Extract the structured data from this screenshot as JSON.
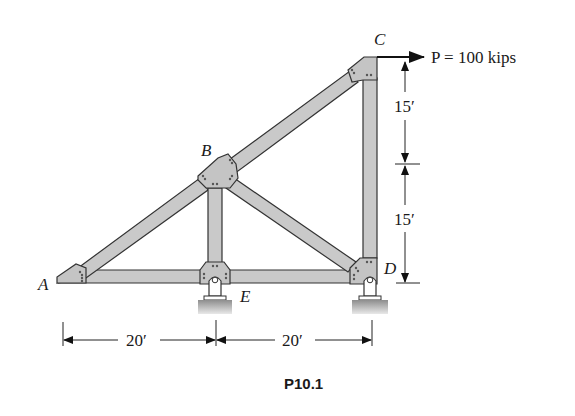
{
  "figure": {
    "caption": "P10.1",
    "type": "plane truss with supports"
  },
  "joints": {
    "A": {
      "label": "A"
    },
    "B": {
      "label": "B"
    },
    "C": {
      "label": "C"
    },
    "D": {
      "label": "D"
    },
    "E": {
      "label": "E"
    }
  },
  "load": {
    "label": "P = 100 kips",
    "joint": "C",
    "direction": "right"
  },
  "dimensions": {
    "horizontal": [
      {
        "label": "20′",
        "from": "A",
        "to": "E"
      },
      {
        "label": "20′",
        "from": "E",
        "to": "D"
      }
    ],
    "vertical": [
      {
        "label": "15′",
        "segment": "upper"
      },
      {
        "label": "15′",
        "segment": "lower"
      }
    ]
  },
  "members": [
    "AB",
    "BC",
    "AE",
    "ED",
    "BE",
    "BD",
    "CD"
  ],
  "supports": [
    {
      "joint": "E",
      "type": "pin"
    },
    {
      "joint": "D",
      "type": "pin"
    }
  ],
  "colors": {
    "member_fill": "#c9c9c9",
    "outline": "#333333",
    "ground": "#9a9a9a"
  }
}
